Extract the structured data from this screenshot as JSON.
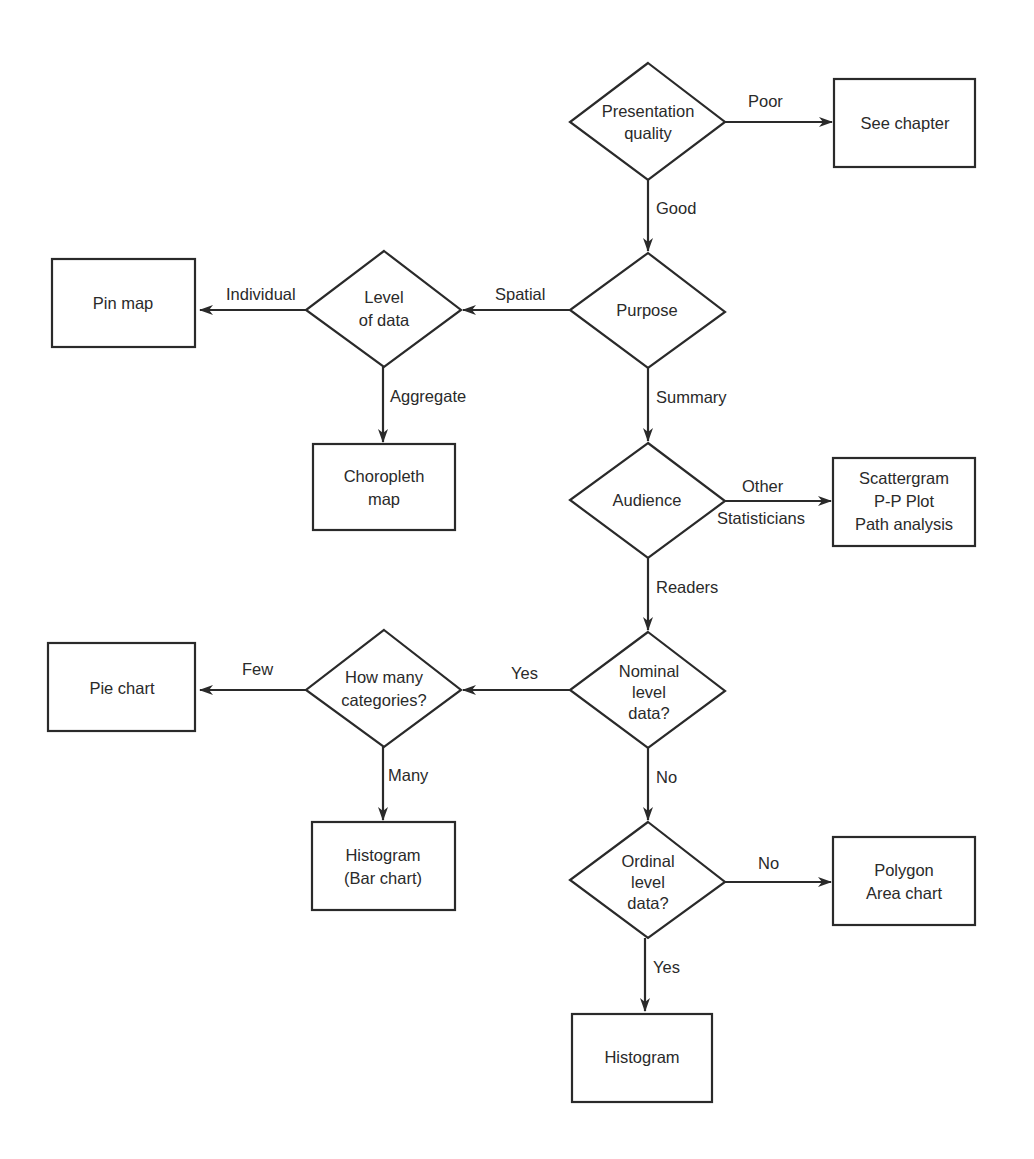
{
  "diagram": {
    "type": "flowchart",
    "nodes": {
      "presentation_quality": {
        "kind": "decision",
        "lines": [
          "Presentation",
          "quality"
        ]
      },
      "see_chapter": {
        "kind": "terminal",
        "lines": [
          "See chapter"
        ]
      },
      "purpose": {
        "kind": "decision",
        "lines": [
          "Purpose"
        ]
      },
      "level_of_data": {
        "kind": "decision",
        "lines": [
          "Level",
          "of data"
        ]
      },
      "pin_map": {
        "kind": "terminal",
        "lines": [
          "Pin map"
        ]
      },
      "choropleth_map": {
        "kind": "terminal",
        "lines": [
          "Choropleth",
          "map"
        ]
      },
      "audience": {
        "kind": "decision",
        "lines": [
          "Audience"
        ]
      },
      "scattergram": {
        "kind": "terminal",
        "lines": [
          "Scattergram",
          "P-P Plot",
          "Path analysis"
        ]
      },
      "nominal": {
        "kind": "decision",
        "lines": [
          "Nominal",
          "level",
          "data?"
        ]
      },
      "how_many": {
        "kind": "decision",
        "lines": [
          "How many",
          "categories?"
        ]
      },
      "pie_chart": {
        "kind": "terminal",
        "lines": [
          "Pie chart"
        ]
      },
      "histogram_bar": {
        "kind": "terminal",
        "lines": [
          "Histogram",
          "(Bar chart)"
        ]
      },
      "ordinal": {
        "kind": "decision",
        "lines": [
          "Ordinal",
          "level",
          "data?"
        ]
      },
      "polygon": {
        "kind": "terminal",
        "lines": [
          "Polygon",
          "Area chart"
        ]
      },
      "histogram": {
        "kind": "terminal",
        "lines": [
          "Histogram"
        ]
      }
    },
    "edges": {
      "poor": {
        "from": "presentation_quality",
        "to": "see_chapter",
        "label": "Poor"
      },
      "good": {
        "from": "presentation_quality",
        "to": "purpose",
        "label": "Good"
      },
      "spatial": {
        "from": "purpose",
        "to": "level_of_data",
        "label": "Spatial"
      },
      "individual": {
        "from": "level_of_data",
        "to": "pin_map",
        "label": "Individual"
      },
      "aggregate": {
        "from": "level_of_data",
        "to": "choropleth_map",
        "label": "Aggregate"
      },
      "summary": {
        "from": "purpose",
        "to": "audience",
        "label": "Summary"
      },
      "other": {
        "from": "audience",
        "to": "scattergram",
        "label": "Other"
      },
      "statisticians": {
        "from": "audience",
        "to": "scattergram",
        "label": "Statisticians"
      },
      "readers": {
        "from": "audience",
        "to": "nominal",
        "label": "Readers"
      },
      "nominal_yes": {
        "from": "nominal",
        "to": "how_many",
        "label": "Yes"
      },
      "few": {
        "from": "how_many",
        "to": "pie_chart",
        "label": "Few"
      },
      "many": {
        "from": "how_many",
        "to": "histogram_bar",
        "label": "Many"
      },
      "nominal_no": {
        "from": "nominal",
        "to": "ordinal",
        "label": "No"
      },
      "ordinal_no": {
        "from": "ordinal",
        "to": "polygon",
        "label": "No"
      },
      "ordinal_yes": {
        "from": "ordinal",
        "to": "histogram",
        "label": "Yes"
      }
    }
  },
  "colors": {
    "stroke": "#2a2a2a",
    "background": "#ffffff"
  }
}
